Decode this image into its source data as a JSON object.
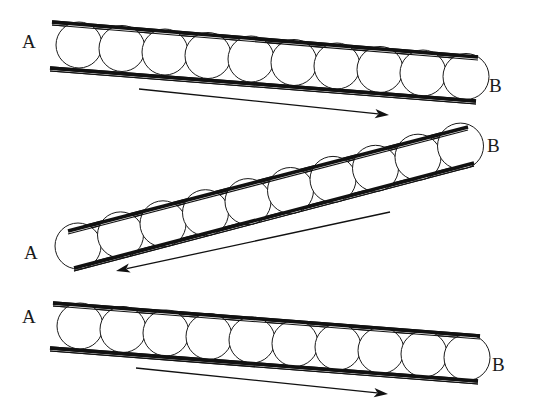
{
  "figure": {
    "background_color": "#ffffff",
    "ink_color": "#111111",
    "sphere_fill": "#ffffff",
    "sphere_stroke": "#1a1a1a",
    "partial_caption_top": "",
    "panel_count": 3,
    "spheres_per_panel": 10
  },
  "panels": [
    {
      "id": "panel-top",
      "label_left": "A",
      "label_right": "B",
      "left_label_pos": {
        "x": 22,
        "y": 48
      },
      "right_label_pos": {
        "x": 489,
        "y": 92
      },
      "tube": {
        "top_wall": {
          "x1": 52,
          "y1": 22,
          "x2": 478,
          "y2": 57
        },
        "bottom_wall": {
          "x1": 50,
          "y1": 68,
          "x2": 476,
          "y2": 101
        },
        "slope_description": "descending-left-to-right"
      },
      "spheres": {
        "count": 10,
        "radius": 23,
        "first_center": {
          "x": 79,
          "y": 45
        },
        "step": {
          "x": 43,
          "y": 3.5
        }
      },
      "arrow": {
        "direction": "right",
        "from": {
          "x": 139,
          "y": 89
        },
        "to": {
          "x": 389,
          "y": 115
        },
        "description": "flow from A to B"
      }
    },
    {
      "id": "panel-middle",
      "label_left": "A",
      "label_right": "B",
      "left_label_pos": {
        "x": 24,
        "y": 259
      },
      "right_label_pos": {
        "x": 487,
        "y": 152
      },
      "tube": {
        "top_wall": {
          "x1": 68,
          "y1": 231,
          "x2": 468,
          "y2": 127
        },
        "bottom_wall": {
          "x1": 74,
          "y1": 268,
          "x2": 474,
          "y2": 163
        },
        "slope_description": "ascending-left-to-right"
      },
      "spheres": {
        "count": 10,
        "radius": 23,
        "first_center": {
          "x": 78,
          "y": 246
        },
        "step": {
          "x": 42.5,
          "y": -11.1
        }
      },
      "arrow": {
        "direction": "left",
        "from": {
          "x": 390,
          "y": 212
        },
        "to": {
          "x": 116,
          "y": 271
        },
        "description": "flow from B to A"
      }
    },
    {
      "id": "panel-bottom",
      "label_left": "A",
      "label_right": "B",
      "left_label_pos": {
        "x": 22,
        "y": 323
      },
      "right_label_pos": {
        "x": 492,
        "y": 371
      },
      "tube": {
        "top_wall": {
          "x1": 53,
          "y1": 303,
          "x2": 480,
          "y2": 336
        },
        "bottom_wall": {
          "x1": 50,
          "y1": 348,
          "x2": 478,
          "y2": 381
        },
        "slope_description": "descending-left-to-right"
      },
      "spheres": {
        "count": 10,
        "radius": 23,
        "first_center": {
          "x": 80,
          "y": 326
        },
        "step": {
          "x": 43,
          "y": 3.5
        }
      },
      "arrow": {
        "direction": "right",
        "from": {
          "x": 136,
          "y": 368
        },
        "to": {
          "x": 388,
          "y": 394
        },
        "description": "flow from A to B"
      }
    }
  ]
}
